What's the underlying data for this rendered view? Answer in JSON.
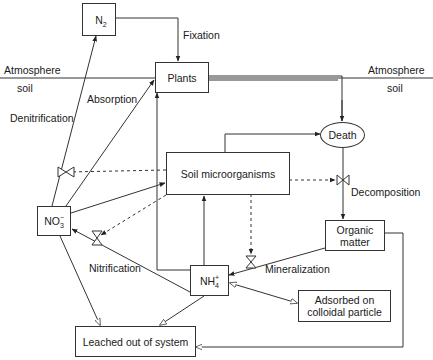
{
  "diagram": {
    "regions": {
      "left_atmosphere": "Atmosphere",
      "left_soil": "soil",
      "right_atmosphere": "Atmosphere",
      "right_soil": "soil"
    },
    "nodes": {
      "n2": {
        "base": "N",
        "sub": "2"
      },
      "plants": {
        "label": "Plants"
      },
      "death": {
        "label": "Death"
      },
      "soil_microorganisms": {
        "label": "Soil microorganisms"
      },
      "no3": {
        "base": "NO",
        "sup": "−",
        "sub": "3"
      },
      "organic_matter": {
        "line1": "Organic",
        "line2": "matter"
      },
      "nh4": {
        "base": "NH",
        "sup": "+",
        "sub": "4"
      },
      "adsorbed": {
        "line1": "Adsorbed on",
        "line2": "colloidal particle"
      },
      "leached": {
        "label": "Leached out of system"
      }
    },
    "processes": {
      "fixation": "Fixation",
      "absorption": "Absorption",
      "denitrification": "Denitrification",
      "decomposition": "Decomposition",
      "nitrification": "Nitrification",
      "mineralization": "Mineralization"
    },
    "edges": [
      {
        "from": "N2",
        "to": "Plants",
        "label": "Fixation",
        "style": "solid"
      },
      {
        "from": "NO3-",
        "to": "N2",
        "label": "Denitrification",
        "style": "solid"
      },
      {
        "from": "NO3-",
        "to": "Plants",
        "label": "Absorption",
        "style": "solid"
      },
      {
        "from": "Plants",
        "to": "Death",
        "style": "double"
      },
      {
        "from": "Soil microorganisms",
        "to": "Death",
        "style": "solid"
      },
      {
        "from": "Death",
        "to": "Organic matter",
        "label": "Decomposition",
        "style": "solid"
      },
      {
        "from": "Soil microorganisms",
        "to": "Decomposition valve",
        "style": "dashed"
      },
      {
        "from": "Soil microorganisms",
        "to": "Denitrification valve",
        "style": "dashed"
      },
      {
        "from": "Soil microorganisms",
        "to": "Nitrification valve",
        "style": "dashed"
      },
      {
        "from": "Soil microorganisms",
        "to": "Mineralization valve",
        "style": "dashed"
      },
      {
        "from": "NO3-",
        "to": "Soil microorganisms",
        "style": "solid"
      },
      {
        "from": "NH4+",
        "to": "Soil microorganisms",
        "style": "solid"
      },
      {
        "from": "NH4+",
        "to": "Plants",
        "style": "solid"
      },
      {
        "from": "NH4+",
        "to": "NO3-",
        "label": "Nitrification",
        "style": "solid"
      },
      {
        "from": "Organic matter",
        "to": "NH4+",
        "label": "Mineralization",
        "style": "solid"
      },
      {
        "from": "NH4+",
        "to": "Adsorbed on colloidal particle",
        "style": "bidirectional"
      },
      {
        "from": "NO3-",
        "to": "Leached out of system",
        "style": "solid"
      },
      {
        "from": "NH4+",
        "to": "Leached out of system",
        "style": "solid"
      },
      {
        "from": "Organic matter",
        "to": "Leached out of system",
        "style": "solid"
      }
    ],
    "colors": {
      "line": "#333333",
      "background": "#ffffff",
      "text": "#1a1a1a"
    }
  }
}
